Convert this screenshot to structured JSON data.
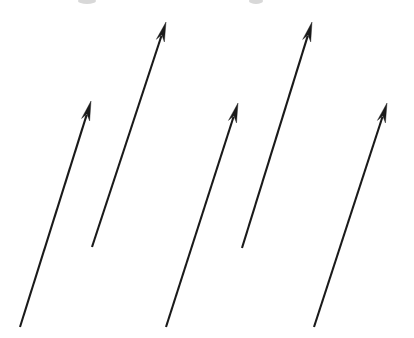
{
  "figure": {
    "width": 414,
    "height": 338,
    "background_color": "#ffffff",
    "stroke_color": "#1a1a1a",
    "arrow_count": "5",
    "arrow_count_label": "5",
    "style": "hand-drawn black line arrows on white background"
  },
  "chart_data": {
    "type": "scatter",
    "xlabel": "",
    "ylabel": "",
    "xlim": [
      0,
      414
    ],
    "ylim": [
      0,
      338
    ],
    "grid": false,
    "legend": "none",
    "arrows": [
      {
        "id": "arrow-1",
        "label": "Arrow 1",
        "tail_x": 20,
        "tail_y": 327,
        "tip_x": 91,
        "tip_y": 101,
        "angle_deg": 72.6,
        "length_px": 237
      },
      {
        "id": "arrow-2",
        "label": "Arrow 2",
        "tail_x": 92,
        "tail_y": 247,
        "tip_x": 166,
        "tip_y": 22,
        "angle_deg": 71.8,
        "length_px": 237
      },
      {
        "id": "arrow-3",
        "label": "Arrow 3",
        "tail_x": 166,
        "tail_y": 327,
        "tip_x": 238,
        "tip_y": 103,
        "angle_deg": 72.2,
        "length_px": 235
      },
      {
        "id": "arrow-4",
        "label": "Arrow 4",
        "tail_x": 242,
        "tail_y": 248,
        "tip_x": 312,
        "tip_y": 22,
        "angle_deg": 72.8,
        "length_px": 237
      },
      {
        "id": "arrow-5",
        "label": "Arrow 5",
        "tail_x": 314,
        "tail_y": 327,
        "tip_x": 387,
        "tip_y": 103,
        "angle_deg": 71.9,
        "length_px": 236
      }
    ],
    "smudges": [
      {
        "id": "smudge-left",
        "cx": 87,
        "cy": 1,
        "rx": 9,
        "ry": 3
      },
      {
        "id": "smudge-right",
        "cx": 256,
        "cy": 1,
        "rx": 7,
        "ry": 3
      }
    ]
  }
}
